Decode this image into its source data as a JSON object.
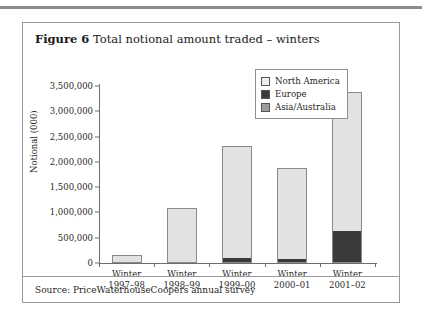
{
  "figure": {
    "label": "Figure 6",
    "title": "Total notional amount traded – winters",
    "source": "Source: PriceWaterhouseCoopers annual survey"
  },
  "legend": {
    "position": "top-right",
    "items": [
      {
        "label": "North America",
        "color": "#eeeeee",
        "swatch": "sw-na"
      },
      {
        "label": "Europe",
        "color": "#3a3a3a",
        "swatch": "sw-eu"
      },
      {
        "label": "Asia/Australia",
        "color": "#9d9d9d",
        "swatch": "sw-aa"
      }
    ]
  },
  "chart_data": {
    "type": "bar",
    "stacked": true,
    "title": "Total notional amount traded – winters",
    "xlabel": "",
    "ylabel": "Notional (000)",
    "ylim": [
      0,
      3500000
    ],
    "ytick_step": 500000,
    "grid": false,
    "legend_position": "top-right",
    "categories": [
      "Winter\n1997–98",
      "Winter\n1998–99",
      "Winter\n1999–00",
      "Winter\n2000–01",
      "Winter\n2001–02"
    ],
    "category_lines": [
      [
        "Winter",
        "1997–98"
      ],
      [
        "Winter",
        "1998–99"
      ],
      [
        "Winter",
        "1999–00"
      ],
      [
        "Winter",
        "2000–01"
      ],
      [
        "Winter",
        "2001–02"
      ]
    ],
    "ytick_labels": [
      "0",
      "500,000",
      "1,000,000",
      "1,500,000",
      "2,000,000",
      "2,500,000",
      "3,000,000",
      "3,500,000"
    ],
    "ytick_values": [
      0,
      500000,
      1000000,
      1500000,
      2000000,
      2500000,
      3000000,
      3500000
    ],
    "series": [
      {
        "name": "Asia/Australia",
        "color": "#9d9d9d",
        "values": [
          0,
          0,
          0,
          0,
          0
        ]
      },
      {
        "name": "Europe",
        "color": "#3a3a3a",
        "values": [
          0,
          0,
          80000,
          70000,
          630000
        ]
      },
      {
        "name": "North America",
        "color": "#e2e2e2",
        "values": [
          158000,
          1090000,
          2230000,
          1810000,
          2750000
        ]
      }
    ],
    "totals": [
      158000,
      1090000,
      2310000,
      1880000,
      3380000
    ]
  }
}
